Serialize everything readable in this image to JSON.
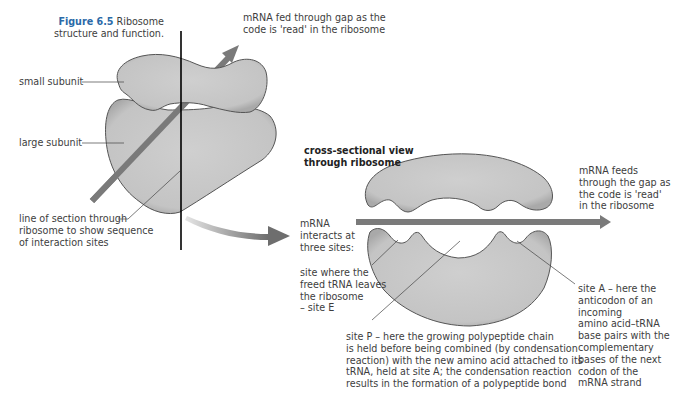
{
  "figure": {
    "number": "Figure 6.5",
    "caption_line1": "Ribosome",
    "caption_line2": "structure and function."
  },
  "labels": {
    "small_subunit": "small subunit",
    "large_subunit": "large subunit",
    "line_of_section": [
      "line of section through",
      "ribosome to show sequence",
      "of interaction sites"
    ],
    "mrna_fed": [
      "mRNA fed through gap as the",
      "code is 'read' in the ribosome"
    ],
    "cross_section_title": [
      "cross-sectional view",
      "through ribosome"
    ],
    "mrna_feeds": [
      "mRNA feeds",
      "through the gap as",
      "the code is 'read'",
      "in the ribosome"
    ],
    "mrna_interacts": [
      "mRNA",
      "interacts at",
      "three sites:"
    ],
    "site_e": [
      "site where the",
      "freed tRNA leaves",
      "the ribosome",
      "– site E"
    ],
    "site_p": [
      "site P – here the growing polypeptide chain",
      "is held before being combined (by condensation",
      "reaction) with the new amino acid attached to its",
      "tRNA, held at site A; the condensation reaction",
      "results in the formation of a polypeptide bond"
    ],
    "site_a": [
      "site A – here the",
      "anticodon of an",
      "incoming",
      "amino acid–tRNA",
      "base pairs with the",
      "complementary",
      "bases of the next",
      "codon of the",
      "mRNA strand"
    ]
  },
  "colors": {
    "subunit_fill": "#c9c9c9",
    "subunit_stroke": "#555555",
    "mrna_arrow": "#7a7a7a",
    "figure_number": "#2b6aa8",
    "leader_line": "#444444",
    "section_line": "#000000"
  }
}
